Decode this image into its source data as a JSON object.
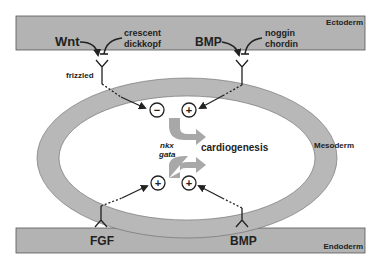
{
  "layers": {
    "ectoderm": "Ectoderm",
    "mesoderm": "Mesoderm",
    "endoderm": "Endoderm"
  },
  "signals": {
    "wnt": "Wnt",
    "wnt_inhibitors": [
      "crescent",
      "dickkopf"
    ],
    "bmp_top": "BMP",
    "bmp_inhibitors": [
      "noggin",
      "chordin"
    ],
    "receptor": "frizzled",
    "fgf": "FGF",
    "bmp_bottom": "BMP"
  },
  "center": {
    "genes": [
      "nkx",
      "gata"
    ],
    "outcome": "cardiogenesis",
    "effects": {
      "top_left": "−",
      "top_right": "+",
      "bottom_left": "+",
      "bottom_right": "+"
    }
  },
  "colors": {
    "band": "#b3b3b3",
    "ring": "#b8b8b8",
    "ink": "#222222",
    "arrow_fill": "#a8a8a8"
  }
}
